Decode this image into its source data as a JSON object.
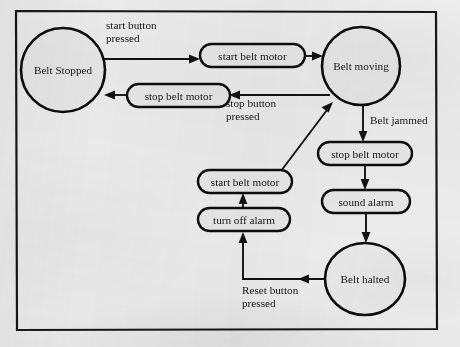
{
  "diagram": {
    "type": "state-transition-diagram",
    "background_color": "#ebeceb",
    "ink_color": "#121212",
    "frame": {
      "x": 15,
      "y": 10,
      "width": 422,
      "height": 320
    },
    "states": [
      {
        "id": "belt-stopped",
        "label": "Belt Stopped",
        "shape": "ellipse",
        "cx": 63,
        "cy": 70,
        "rx": 42,
        "ry": 42
      },
      {
        "id": "belt-moving",
        "label": "Belt moving",
        "shape": "ellipse",
        "cx": 361,
        "cy": 66,
        "rx": 39,
        "ry": 39
      },
      {
        "id": "belt-halted",
        "label": "Belt halted",
        "shape": "ellipse",
        "cx": 365,
        "cy": 279,
        "rx": 40,
        "ry": 36
      }
    ],
    "actions": [
      {
        "id": "start-belt-motor-top",
        "label": "start belt motor",
        "shape": "rounded-rect",
        "x": 200,
        "y": 44,
        "width": 105,
        "height": 23
      },
      {
        "id": "stop-belt-motor-left",
        "label": "stop belt motor",
        "shape": "rounded-rect",
        "x": 127,
        "y": 84,
        "width": 103,
        "height": 23
      },
      {
        "id": "stop-belt-motor-right",
        "label": "stop belt motor",
        "shape": "rounded-rect",
        "x": 318,
        "y": 142,
        "width": 94,
        "height": 23
      },
      {
        "id": "sound-alarm",
        "label": "sound alarm",
        "shape": "rounded-rect",
        "x": 322,
        "y": 190,
        "width": 88,
        "height": 23
      },
      {
        "id": "start-belt-motor-lower",
        "label": "start belt motor",
        "shape": "rounded-rect",
        "x": 198,
        "y": 170,
        "width": 94,
        "height": 23
      },
      {
        "id": "turn-off-alarm",
        "label": "turn off alarm",
        "shape": "rounded-rect",
        "x": 198,
        "y": 208,
        "width": 92,
        "height": 23
      }
    ],
    "transitions": [
      {
        "id": "t-start-pressed",
        "label": "start button\npressed",
        "from": "belt-stopped",
        "to": "start-belt-motor-top",
        "label_x": 106,
        "label_y": 29
      },
      {
        "id": "t-stop-pressed",
        "label": "stop button\npressed",
        "from": "belt-moving",
        "to": "stop-belt-motor-left",
        "label_x": 226,
        "label_y": 107
      },
      {
        "id": "t-belt-jammed",
        "label": "Belt jammed",
        "from": "belt-moving",
        "to": "stop-belt-motor-right",
        "label_x": 368,
        "label_y": 124
      },
      {
        "id": "t-reset-pressed",
        "label": "Reset button\npressed",
        "from": "belt-halted",
        "to": "turn-off-alarm",
        "label_x": 242,
        "label_y": 294
      },
      {
        "id": "t-motor-started",
        "label": "",
        "from": "start-belt-motor-top",
        "to": "belt-moving"
      },
      {
        "id": "t-alarm-sounded",
        "label": "",
        "from": "stop-belt-motor-right",
        "to": "sound-alarm"
      },
      {
        "id": "t-belt-stops",
        "label": "",
        "from": "sound-alarm",
        "to": "belt-halted"
      },
      {
        "id": "t-alarm-off",
        "label": "",
        "from": "turn-off-alarm",
        "to": "start-belt-motor-lower"
      },
      {
        "id": "t-restart",
        "label": "",
        "from": "start-belt-motor-lower",
        "to": "belt-moving"
      }
    ],
    "labels": {
      "start_button_pressed_line1": "start button",
      "start_button_pressed_line2": "pressed",
      "stop_button_pressed_line1": "stop button",
      "stop_button_pressed_line2": "pressed",
      "belt_jammed": "Belt jammed",
      "reset_button_pressed_line1": "Reset button",
      "reset_button_pressed_line2": "pressed",
      "belt_stopped": "Belt Stopped",
      "belt_moving": "Belt moving",
      "belt_halted": "Belt halted",
      "start_belt_motor_top": "start belt motor",
      "stop_belt_motor_left": "stop belt motor",
      "stop_belt_motor_right": "stop belt motor",
      "sound_alarm": "sound alarm",
      "start_belt_motor_lower": "start belt motor",
      "turn_off_alarm": "turn off alarm"
    }
  }
}
